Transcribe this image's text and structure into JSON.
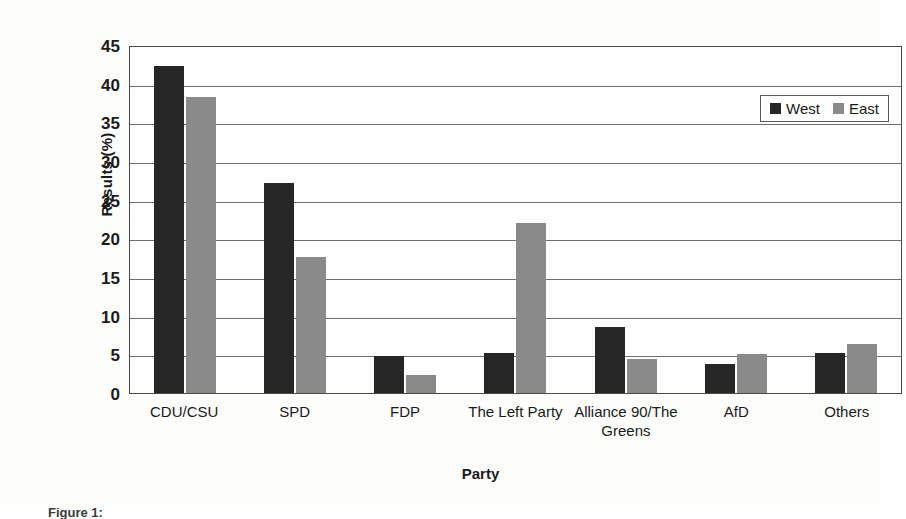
{
  "chart_data": {
    "type": "bar",
    "title": "",
    "xlabel": "Party",
    "ylabel": "Results (%)",
    "categories": [
      "CDU/CSU",
      "SPD",
      "FDP",
      "The Left Party",
      "Alliance 90/The Greens",
      "AfD",
      "Others"
    ],
    "series": [
      {
        "name": "West",
        "color": "#262626",
        "values": [
          42.3,
          27.1,
          4.8,
          5.2,
          8.6,
          3.7,
          5.2
        ]
      },
      {
        "name": "East",
        "color": "#8a8a8a",
        "values": [
          38.3,
          17.6,
          2.3,
          22.0,
          4.4,
          5.0,
          6.4
        ]
      }
    ],
    "ylim": [
      0,
      45
    ],
    "ytick_step": 5,
    "yticks": [
      "45",
      "40",
      "35",
      "30",
      "25",
      "20",
      "15",
      "10",
      "5",
      "0"
    ],
    "grid": true,
    "legend_position": "top-right",
    "legend_entries": [
      "West",
      "East"
    ]
  },
  "caption": {
    "text": "Figure 1:"
  }
}
